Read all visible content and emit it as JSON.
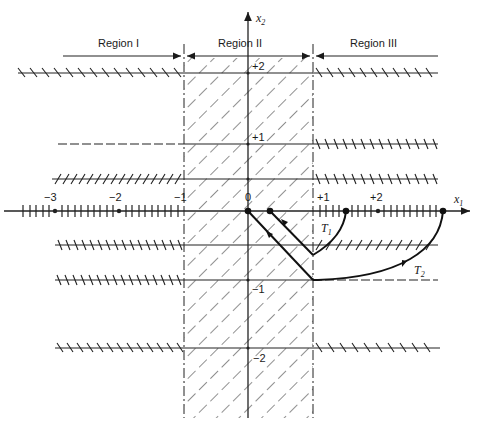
{
  "figure": {
    "regions": [
      {
        "label": "Region I"
      },
      {
        "label": "Region II"
      },
      {
        "label": "Region III"
      }
    ],
    "axes": {
      "x_label": "x",
      "x_sub": "1",
      "y_label": "x",
      "y_sub": "2",
      "x_ticks": [
        {
          "label": "−3"
        },
        {
          "label": "−2"
        },
        {
          "label": "−1"
        },
        {
          "label": "0"
        },
        {
          "label": "+1"
        },
        {
          "label": "+2"
        }
      ],
      "y_ticks": [
        {
          "label": "+2"
        },
        {
          "label": "+1"
        },
        {
          "label": "−1"
        },
        {
          "label": "−2"
        }
      ]
    },
    "trajectories": [
      {
        "label": "T",
        "sub": "1"
      },
      {
        "label": "T",
        "sub": "2"
      }
    ],
    "colors": {
      "ink": "#1a1a1a",
      "background": "#ffffff"
    }
  }
}
